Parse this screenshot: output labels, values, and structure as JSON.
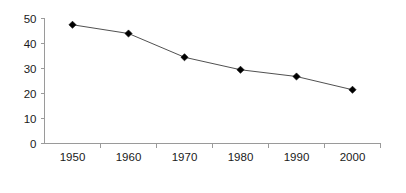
{
  "chart_data": {
    "type": "line",
    "title": "",
    "subtitle": "",
    "xlabel": "",
    "ylabel": "",
    "categories": [
      "1950",
      "1960",
      "1970",
      "1980",
      "1990",
      "2000"
    ],
    "x": [
      1950,
      1960,
      1970,
      1980,
      1990,
      2000
    ],
    "values": [
      47.5,
      44,
      34.5,
      29.5,
      26.8,
      21.5
    ],
    "series": [
      {
        "name": "",
        "values": [
          47.5,
          44,
          34.5,
          29.5,
          26.8,
          21.5
        ],
        "marker": "diamond",
        "marker_color": "#000000",
        "line_color": "#3c3c3c"
      }
    ],
    "ylim": [
      0,
      50
    ],
    "yticks": [
      0,
      10,
      20,
      30,
      40,
      50
    ],
    "ytick_labels": [
      "0",
      "10",
      "20",
      "30",
      "40",
      "50"
    ],
    "xtick_labels": [
      "1950",
      "1960",
      "1970",
      "1980",
      "1990",
      "2000"
    ],
    "grid": false,
    "legend": false,
    "legend_position": "none",
    "axis_color": "#9a9a9a",
    "background_color": "#ffffff",
    "text_color": "#1a1a1a"
  }
}
